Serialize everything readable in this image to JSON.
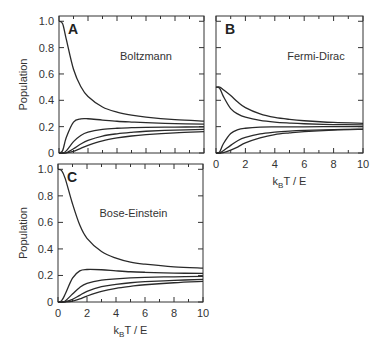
{
  "chart_data": [
    {
      "type": "line",
      "panel_label": "A",
      "title": "Boltzmann",
      "xlabel": "",
      "ylabel": "Population",
      "xlim": [
        0,
        10
      ],
      "ylim": [
        0,
        1.04
      ],
      "xticks": [],
      "yticks": [
        "0",
        "0.2",
        "0.4",
        "0.6",
        "0.8",
        "1.0"
      ],
      "x": [
        0,
        0.25,
        0.5,
        1,
        1.5,
        2,
        3,
        4,
        5,
        6,
        8,
        10
      ],
      "series": [
        {
          "name": "level 0",
          "values": [
            1.0,
            0.982,
            0.865,
            0.636,
            0.505,
            0.429,
            0.349,
            0.31,
            0.287,
            0.272,
            0.253,
            0.242
          ]
        },
        {
          "name": "level 1",
          "values": [
            0,
            0.018,
            0.117,
            0.234,
            0.259,
            0.26,
            0.25,
            0.241,
            0.235,
            0.23,
            0.223,
            0.219
          ]
        },
        {
          "name": "level 2",
          "values": [
            0,
            0.0003,
            0.016,
            0.086,
            0.133,
            0.158,
            0.179,
            0.188,
            0.192,
            0.195,
            0.197,
            0.198
          ]
        },
        {
          "name": "level 3",
          "values": [
            0,
            0,
            0.002,
            0.032,
            0.068,
            0.096,
            0.129,
            0.146,
            0.157,
            0.165,
            0.174,
            0.179
          ]
        },
        {
          "name": "level 4",
          "values": [
            0,
            0,
            0.0003,
            0.012,
            0.035,
            0.058,
            0.092,
            0.114,
            0.129,
            0.139,
            0.153,
            0.162
          ]
        }
      ]
    },
    {
      "type": "line",
      "panel_label": "B",
      "title": "Fermi-Dirac",
      "xlabel": "kBT / E",
      "ylabel": "",
      "xlim": [
        0,
        10
      ],
      "ylim": [
        0,
        1.04
      ],
      "xticks": [
        "0",
        "2",
        "4",
        "6",
        "8",
        "10"
      ],
      "yticks": [],
      "x": [
        0,
        0.25,
        0.5,
        1,
        1.5,
        2,
        3,
        4,
        5,
        6,
        8,
        10
      ],
      "series": [
        {
          "name": "level 0",
          "values": [
            0.5,
            0.5,
            0.48,
            0.436,
            0.385,
            0.345,
            0.297,
            0.27,
            0.255,
            0.245,
            0.232,
            0.225
          ]
        },
        {
          "name": "level 1",
          "values": [
            0.5,
            0.491,
            0.43,
            0.337,
            0.295,
            0.272,
            0.247,
            0.234,
            0.227,
            0.222,
            0.216,
            0.213
          ]
        },
        {
          "name": "level 2",
          "values": [
            0,
            0.009,
            0.07,
            0.148,
            0.178,
            0.188,
            0.196,
            0.198,
            0.199,
            0.199,
            0.2,
            0.2
          ]
        },
        {
          "name": "level 3",
          "values": [
            0,
            0,
            0.017,
            0.058,
            0.095,
            0.118,
            0.145,
            0.158,
            0.166,
            0.171,
            0.178,
            0.182
          ]
        },
        {
          "name": "level 4",
          "values": [
            0,
            0,
            0.003,
            0.022,
            0.047,
            0.077,
            0.115,
            0.14,
            0.153,
            0.163,
            0.174,
            0.18
          ]
        }
      ]
    },
    {
      "type": "line",
      "panel_label": "C",
      "title": "Bose-Einstein",
      "xlabel": "kBT / E",
      "ylabel": "Population",
      "xlim": [
        0,
        10
      ],
      "ylim": [
        0,
        1.04
      ],
      "xticks": [
        "0",
        "2",
        "4",
        "6",
        "8",
        "10"
      ],
      "yticks": [
        "0",
        "0.2",
        "0.4",
        "0.6",
        "0.8",
        "1.0"
      ],
      "x": [
        0,
        0.25,
        0.5,
        1,
        1.5,
        2,
        3,
        4,
        5,
        6,
        8,
        10
      ],
      "series": [
        {
          "name": "level 0",
          "values": [
            1.0,
            0.99,
            0.93,
            0.74,
            0.58,
            0.48,
            0.38,
            0.33,
            0.3,
            0.285,
            0.265,
            0.255
          ]
        },
        {
          "name": "level 1",
          "values": [
            0,
            0.01,
            0.06,
            0.18,
            0.235,
            0.245,
            0.243,
            0.235,
            0.228,
            0.224,
            0.218,
            0.215
          ]
        },
        {
          "name": "level 2",
          "values": [
            0,
            0,
            0.008,
            0.06,
            0.11,
            0.14,
            0.165,
            0.175,
            0.182,
            0.186,
            0.19,
            0.193
          ]
        },
        {
          "name": "level 3",
          "values": [
            0,
            0,
            0.002,
            0.02,
            0.05,
            0.08,
            0.115,
            0.132,
            0.145,
            0.153,
            0.163,
            0.17
          ]
        },
        {
          "name": "level 4",
          "values": [
            0,
            0,
            0,
            0.006,
            0.023,
            0.045,
            0.08,
            0.103,
            0.118,
            0.13,
            0.145,
            0.155
          ]
        }
      ]
    }
  ]
}
